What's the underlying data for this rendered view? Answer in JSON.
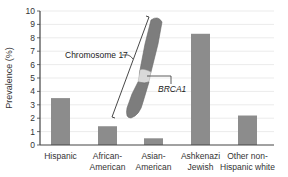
{
  "chart_data": {
    "type": "bar",
    "title": "",
    "xlabel": "",
    "ylabel": "Prevalence (%)",
    "ylim": [
      0,
      10
    ],
    "yticks": [
      0,
      1,
      2,
      3,
      4,
      5,
      6,
      7,
      8,
      9,
      10
    ],
    "grid": true,
    "legend": null,
    "categories": [
      [
        "Hispanic"
      ],
      [
        "African-",
        "American"
      ],
      [
        "Asian-",
        "American"
      ],
      [
        "Ashkenazi",
        "Jewish"
      ],
      [
        "Other non-",
        "Hispanic white"
      ]
    ],
    "category_names": [
      "Hispanic",
      "African-American",
      "Asian-American",
      "Ashkenazi Jewish",
      "Other non-Hispanic white"
    ],
    "values": [
      3.5,
      1.4,
      0.5,
      8.3,
      2.2
    ],
    "annotations": [
      {
        "text": "Chromosome 17",
        "type": "label-with-bracket"
      },
      {
        "text": "BRCA1",
        "type": "gene-locus-label",
        "italic": true
      }
    ],
    "colors": {
      "bar": "#8c8c8c",
      "axis": "#444444",
      "grid": "#e6e6e6",
      "chromosome": "#7d7d7d",
      "chromosome_band": "#d9d9d9"
    }
  }
}
